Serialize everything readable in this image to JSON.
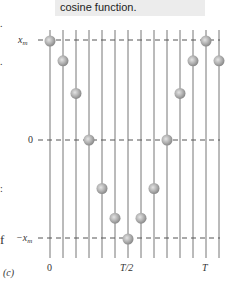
{
  "caption": {
    "text": "cosine function."
  },
  "edge_fragments": [
    {
      "text": ".",
      "top": 18
    },
    {
      "text": ".",
      "top": 56
    },
    {
      "text": ":",
      "top": 183
    },
    {
      "text": "f",
      "top": 232
    }
  ],
  "figure": {
    "panel_label": "(c)",
    "y_labels": {
      "max": "x_m",
      "zero": "0",
      "min": "−x_m"
    },
    "x_labels": [
      "0",
      "T/2",
      "T"
    ],
    "line_color": "#777777",
    "ball_color": "#aaaaaa",
    "dash_color": "#555555"
  },
  "chart_data": {
    "type": "scatter",
    "title": "cosine function.",
    "xlabel": "t",
    "ylabel": "x",
    "x_tick_labels": [
      "0",
      "T/2",
      "T"
    ],
    "y_tick_labels": [
      "x_m",
      "0",
      "−x_m"
    ],
    "x": [
      0,
      0.083,
      0.167,
      0.25,
      0.333,
      0.417,
      0.5,
      0.583,
      0.667,
      0.75,
      0.833,
      0.917,
      1.0,
      1.083
    ],
    "values": [
      1.0,
      0.8,
      0.47,
      0.0,
      -0.49,
      -0.79,
      -1.0,
      -0.79,
      -0.49,
      0.0,
      0.47,
      0.8,
      1.0,
      0.8
    ],
    "x_units": "T",
    "y_units": "x_m",
    "ylim": [
      -1,
      1
    ],
    "grid": true,
    "panel": "(c)"
  }
}
